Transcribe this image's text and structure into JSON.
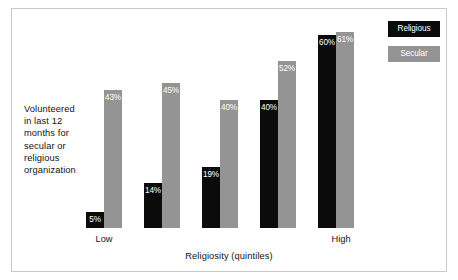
{
  "chart_data": {
    "type": "bar",
    "title": "",
    "subtitle": "",
    "categories": [
      "Low",
      "2",
      "3",
      "4",
      "High"
    ],
    "x": [
      "Low",
      "",
      "",
      "",
      "High"
    ],
    "series": [
      {
        "name": "Religious",
        "color": "#0b0b0b",
        "values": [
          5,
          14,
          19,
          40,
          60
        ],
        "labels": [
          "5%",
          "14%",
          "19%",
          "40%",
          "60%"
        ]
      },
      {
        "name": "Secular",
        "color": "#949494",
        "values": [
          43,
          45,
          40,
          52,
          61
        ],
        "labels": [
          "43%",
          "45%",
          "40%",
          "52%",
          "61%"
        ]
      }
    ],
    "xlabel": "Religiosity (quintiles)",
    "ylabel": "Volunteered in last 12 months for secular or religious organization",
    "ylim": [
      0,
      66
    ],
    "grid": false,
    "legend_position": "top-right",
    "value_label_format": "percent"
  },
  "axis": {
    "y_label_lines": [
      "Volunteered",
      "in last 12",
      "months for",
      "secular or",
      "religious",
      "organization"
    ],
    "x_title": "Religiosity (quintiles)",
    "x_tick_low": "Low",
    "x_tick_high": "High"
  },
  "legend": {
    "items": [
      {
        "label": "Religious",
        "color": "#0b0b0b"
      },
      {
        "label": "Secular",
        "color": "#949494"
      }
    ]
  },
  "bars": {
    "groups": [
      {
        "religious": {
          "label": "5%",
          "height_pct": 7.6
        },
        "secular": {
          "label": "43%",
          "height_pct": 65.2
        }
      },
      {
        "religious": {
          "label": "14%",
          "height_pct": 21.2
        },
        "secular": {
          "label": "45%",
          "height_pct": 68.2
        }
      },
      {
        "religious": {
          "label": "19%",
          "height_pct": 28.8
        },
        "secular": {
          "label": "40%",
          "height_pct": 60.6
        }
      },
      {
        "religious": {
          "label": "40%",
          "height_pct": 60.6
        },
        "secular": {
          "label": "52%",
          "height_pct": 78.8
        }
      },
      {
        "religious": {
          "label": "60%",
          "height_pct": 90.9
        },
        "secular": {
          "label": "61%",
          "height_pct": 92.4
        }
      }
    ]
  },
  "colors": {
    "religious": "#0b0b0b",
    "secular": "#949494",
    "frame": "#c9c9c9",
    "text": "#131313",
    "value_text": "#ffffff",
    "background": "#ffffff"
  }
}
